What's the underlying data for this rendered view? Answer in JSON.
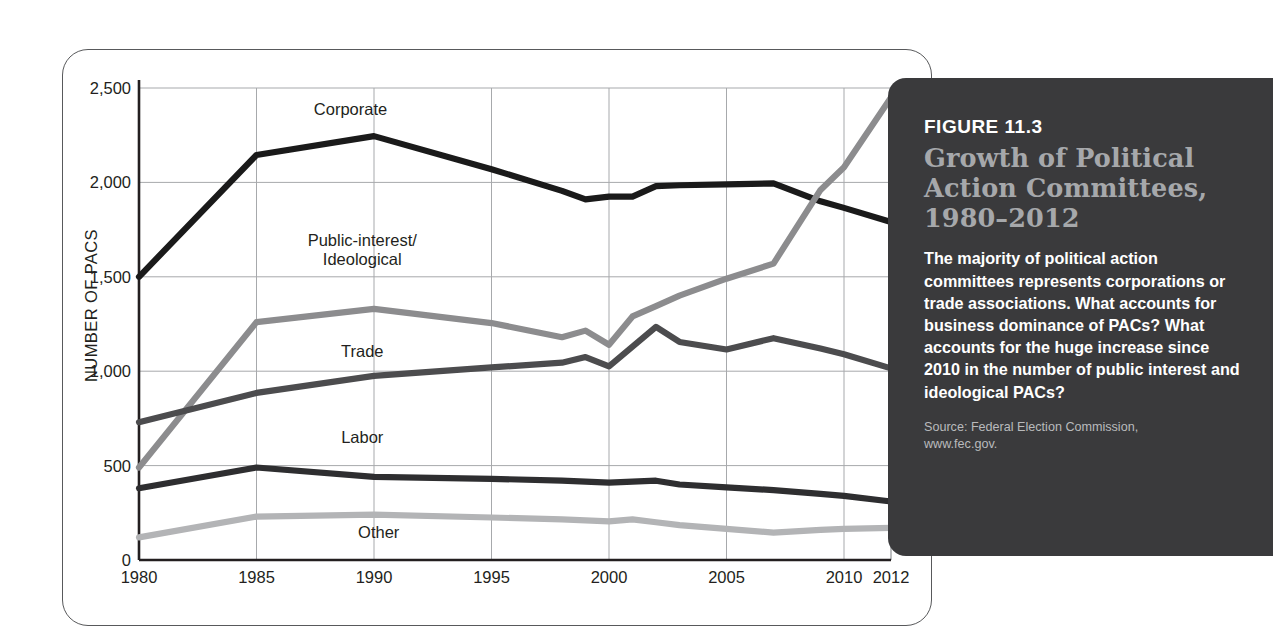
{
  "figure": {
    "number_label": "FIGURE 11.3",
    "title_lines": [
      "Growth of Political",
      "Action Committees,",
      "1980–2012"
    ],
    "body": "The majority of political action committees represents corporations or trade associations. What accounts for business dominance of PACs? What accounts for the huge increase since 2010 in the number of public interest and ideological PACs?",
    "source_lines": [
      "Source: Federal Election Commission,",
      "www.fec.gov."
    ]
  },
  "colors": {
    "panel_bg": "#3a3a3c",
    "panel_title": "#a6a8ab",
    "panel_text": "#ffffff",
    "panel_source": "#b9babc",
    "card_border": "#58595b",
    "grid": "#a7a9ac",
    "axis": "#231f20",
    "corporate": "#1a1a1a",
    "public_interest": "#8c8c8e",
    "trade": "#4c4c4e",
    "labor": "#2e2e30",
    "other": "#b3b4b6"
  },
  "chart_data": {
    "type": "line",
    "xlabel": "",
    "ylabel": "NUMBER OF PACS",
    "xlim": [
      1980,
      2012
    ],
    "ylim": [
      0,
      2500
    ],
    "ytick_labels": [
      "0",
      "500",
      "1,000",
      "1,500",
      "2,000",
      "2,500"
    ],
    "ytick_values": [
      0,
      500,
      1000,
      1500,
      2000,
      2500
    ],
    "xtick_labels": [
      "1980",
      "1985",
      "1990",
      "1995",
      "2000",
      "2005",
      "2010",
      "2012"
    ],
    "xtick_values": [
      1980,
      1985,
      1990,
      1995,
      2000,
      2005,
      2010,
      2012
    ],
    "grid": true,
    "legend": "inline-labels",
    "x": [
      1980,
      1985,
      1990,
      1995,
      1998,
      1999,
      2000,
      2001,
      2002,
      2003,
      2005,
      2007,
      2009,
      2010,
      2012
    ],
    "series": [
      {
        "name": "Corporate",
        "color": "#1a1a1a",
        "label_x": 1989.0,
        "label_y": 2390,
        "values": [
          1500,
          2145,
          2245,
          2070,
          1955,
          1910,
          1925,
          1925,
          1980,
          1985,
          1990,
          1995,
          1900,
          1865,
          1790
        ]
      },
      {
        "name": "Public-interest/\nIdeological",
        "color": "#8c8c8e",
        "label_x": 1989.5,
        "label_y": 1645,
        "values": [
          490,
          1260,
          1330,
          1255,
          1180,
          1215,
          1140,
          1290,
          1345,
          1400,
          1490,
          1570,
          1960,
          2080,
          2450
        ]
      },
      {
        "name": "Trade",
        "color": "#4c4c4e",
        "label_x": 1989.5,
        "label_y": 1105,
        "values": [
          730,
          885,
          975,
          1020,
          1045,
          1075,
          1025,
          1130,
          1235,
          1155,
          1115,
          1175,
          1120,
          1090,
          1015
        ]
      },
      {
        "name": "Labor",
        "color": "#2e2e30",
        "label_x": 1989.5,
        "label_y": 650,
        "values": [
          380,
          490,
          440,
          430,
          420,
          415,
          410,
          415,
          420,
          400,
          385,
          370,
          350,
          340,
          310
        ]
      },
      {
        "name": "Other",
        "color": "#b3b4b6",
        "label_x": 1990.2,
        "label_y": 150,
        "values": [
          120,
          230,
          240,
          225,
          215,
          210,
          205,
          215,
          200,
          185,
          165,
          145,
          160,
          165,
          170
        ]
      }
    ]
  }
}
